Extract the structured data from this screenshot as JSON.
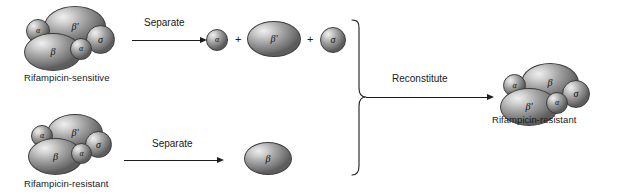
{
  "figure": {
    "background_color": "#ffffff",
    "ink_color": "#1c1c1c",
    "subunit_fill_light": "#efefef",
    "subunit_fill_dark": "#5d5d5d",
    "subunit_outline": "#3d3d3d"
  },
  "glyphs": {
    "alpha": "α",
    "beta": "β",
    "beta_prime": "β′",
    "sigma": "σ",
    "plus": "+"
  },
  "complexes": {
    "sensitive_holoenzyme": {
      "caption": "Rifampicin-sensitive",
      "subunits": [
        {
          "label": "α",
          "role": "alpha"
        },
        {
          "label": "β′",
          "role": "beta-prime"
        },
        {
          "label": "σ",
          "role": "sigma"
        },
        {
          "label": "α",
          "role": "alpha"
        },
        {
          "label": "β",
          "role": "beta"
        }
      ]
    },
    "resistant_holoenzyme": {
      "caption": "Rifampicin-resistant",
      "subunits": [
        {
          "label": "α",
          "role": "alpha"
        },
        {
          "label": "β′",
          "role": "beta-prime"
        },
        {
          "label": "σ",
          "role": "sigma"
        },
        {
          "label": "α",
          "role": "alpha"
        },
        {
          "label": "β",
          "role": "beta"
        }
      ]
    },
    "reconstituted_holoenzyme": {
      "caption": "Rifampicin-resistant",
      "subunits": [
        {
          "label": "α",
          "role": "alpha"
        },
        {
          "label": "β",
          "role": "beta"
        },
        {
          "label": "σ",
          "role": "sigma"
        },
        {
          "label": "α",
          "role": "alpha"
        },
        {
          "label": "β′",
          "role": "beta-prime"
        }
      ]
    }
  },
  "separated_top": {
    "parts": [
      {
        "label": "α",
        "role": "alpha"
      },
      {
        "label": "β′",
        "role": "beta-prime"
      },
      {
        "label": "σ",
        "role": "sigma"
      }
    ],
    "operator_1": "+",
    "operator_2": "+"
  },
  "separated_bottom": {
    "parts": [
      {
        "label": "β",
        "role": "beta"
      }
    ]
  },
  "arrows": {
    "separate_top": "Separate",
    "separate_bottom": "Separate",
    "reconstitute": "Reconstitute"
  }
}
